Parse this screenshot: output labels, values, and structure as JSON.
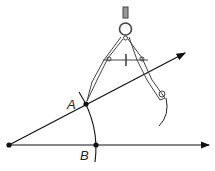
{
  "diagram": {
    "points": [
      {
        "id": "A",
        "label": "A",
        "x": 86,
        "y": 104
      },
      {
        "id": "B",
        "label": "B",
        "x": 96,
        "y": 145
      },
      {
        "id": "O",
        "label": "",
        "x": 9,
        "y": 145
      }
    ],
    "colors": {
      "stroke": "#111111",
      "tool": "#555555",
      "background": "#ffffff"
    }
  }
}
